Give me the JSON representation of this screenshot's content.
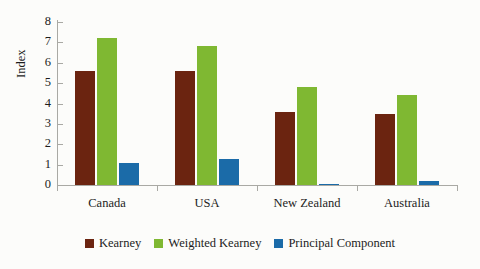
{
  "chart_data": {
    "type": "bar",
    "title": "",
    "xlabel": "",
    "ylabel": "Index",
    "categories": [
      "Canada",
      "USA",
      "New Zealand",
      "Australia"
    ],
    "series": [
      {
        "name": "Kearney",
        "color": "#6b2410",
        "values": [
          5.6,
          5.6,
          3.6,
          3.5
        ]
      },
      {
        "name": "Weighted Kearney",
        "color": "#7fb832",
        "values": [
          7.2,
          6.8,
          4.8,
          4.4
        ]
      },
      {
        "name": "Principal Component",
        "color": "#1b6ba8",
        "values": [
          1.1,
          1.3,
          0.07,
          0.2
        ]
      }
    ],
    "ylim": [
      0,
      8
    ],
    "yticks": [
      "0",
      "1",
      "2",
      "3",
      "4",
      "5",
      "6",
      "7",
      "8"
    ],
    "grid": false,
    "legend_position": "bottom"
  },
  "legend": {
    "items": [
      {
        "label": "Kearney"
      },
      {
        "label": "Weighted Kearney"
      },
      {
        "label": "Principal Component"
      }
    ]
  }
}
